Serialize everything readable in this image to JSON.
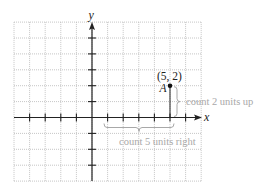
{
  "figure": {
    "axes": {
      "x_label": "x",
      "y_label": "y",
      "x_range": [
        -5,
        7
      ],
      "y_range": [
        -4,
        6
      ],
      "x_ticks": [
        -4,
        -3,
        -2,
        -1,
        1,
        2,
        3,
        4,
        5,
        6
      ],
      "y_ticks": [
        -3,
        -2,
        -1,
        1,
        2,
        3,
        4,
        5
      ],
      "grid": true
    },
    "point": {
      "name": "A",
      "coords_label": "(5, 2)",
      "x": 5,
      "y": 2
    },
    "annotations": {
      "horizontal": "count 5 units right",
      "vertical": "count 2 units up"
    },
    "colors": {
      "axis": "#222222",
      "grid": "#b8b8b8",
      "annotation": "#a8a8a8",
      "point": "#111111"
    }
  }
}
